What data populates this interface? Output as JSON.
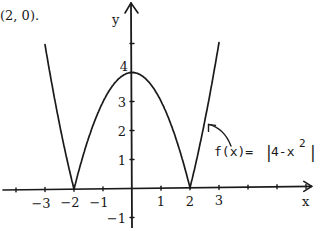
{
  "caption_fragment": "(2, 0).",
  "chart_data": {
    "type": "line",
    "title": "",
    "function_label": "f(x) = |4−x²|",
    "function_label_parts": {
      "prefix": "f(x)= ",
      "abs_open": "|",
      "body": "4-x",
      "exp": "2",
      "abs_close": "|"
    },
    "xlabel": "x",
    "ylabel": "y",
    "xlim": [
      -4.5,
      6.2
    ],
    "ylim": [
      -1.4,
      6.4
    ],
    "x_ticks": [
      -4,
      -3,
      -2,
      -1,
      0,
      1,
      2,
      3,
      4,
      5,
      6
    ],
    "x_tick_labels": [
      {
        "value": -3,
        "text": "−3"
      },
      {
        "value": -2,
        "text": "−2"
      },
      {
        "value": -1,
        "text": "−1"
      },
      {
        "value": 1,
        "text": "1"
      },
      {
        "value": 2,
        "text": "2"
      },
      {
        "value": 3,
        "text": "3"
      }
    ],
    "y_ticks": [
      -1,
      1,
      2,
      3,
      4,
      5
    ],
    "y_tick_labels": [
      {
        "value": 4,
        "text": "4"
      },
      {
        "value": 3,
        "text": "3"
      },
      {
        "value": 2,
        "text": "2"
      },
      {
        "value": 1,
        "text": "1"
      },
      {
        "value": -1,
        "text": "−1"
      }
    ],
    "series": [
      {
        "name": "f(x) = |4 − x²|",
        "x_range": [
          -3,
          3
        ],
        "key_points": [
          {
            "x": -3,
            "y": 5
          },
          {
            "x": -2,
            "y": 0
          },
          {
            "x": 0,
            "y": 4
          },
          {
            "x": 2,
            "y": 0
          },
          {
            "x": 3,
            "y": 5
          }
        ]
      }
    ],
    "annotation": {
      "text": "f(x) = |4−x²|",
      "points_to": {
        "x": 2.5,
        "y": 2.25
      }
    },
    "grid": false
  }
}
